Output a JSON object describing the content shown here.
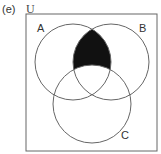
{
  "figure": {
    "label": "(e)",
    "universe_label": "U",
    "sets": [
      {
        "name": "A",
        "cx": 73,
        "cy": 62,
        "r": 38
      },
      {
        "name": "B",
        "cx": 111,
        "cy": 62,
        "r": 38
      },
      {
        "name": "C",
        "cx": 92,
        "cy": 104,
        "r": 39
      }
    ],
    "shaded_region": "A ∩ B ∩ C'",
    "shade_color": "#111111",
    "stroke_color": "#666666"
  }
}
